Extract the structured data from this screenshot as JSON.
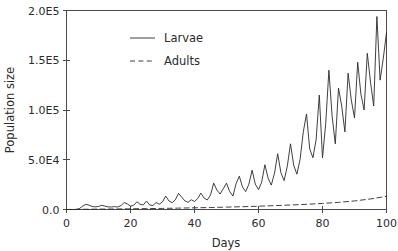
{
  "chart_data": {
    "type": "line",
    "title": "",
    "xlabel": "Days",
    "ylabel": "Population size",
    "xlim": [
      0,
      100
    ],
    "ylim": [
      0,
      200000
    ],
    "grid": false,
    "legend_position": "upper-left-inside",
    "xticks": [
      0,
      20,
      40,
      60,
      80,
      100
    ],
    "xticklabels": [
      "0",
      "20",
      "40",
      "60",
      "80",
      "100"
    ],
    "yticks": [
      0,
      50000,
      100000,
      150000,
      200000
    ],
    "yticklabels": [
      "0.0",
      "5.0E4",
      "1.0E5",
      "1.5E5",
      "2.0E5"
    ],
    "series": [
      {
        "name": "Larvae",
        "style": "solid",
        "color": "#2a2a2a",
        "x": [
          0,
          1,
          2,
          3,
          4,
          5,
          6,
          7,
          8,
          9,
          10,
          11,
          12,
          13,
          14,
          15,
          16,
          17,
          18,
          19,
          20,
          21,
          22,
          23,
          24,
          25,
          26,
          27,
          28,
          29,
          30,
          31,
          32,
          33,
          34,
          35,
          36,
          37,
          38,
          39,
          40,
          41,
          42,
          43,
          44,
          45,
          46,
          47,
          48,
          49,
          50,
          51,
          52,
          53,
          54,
          55,
          56,
          57,
          58,
          59,
          60,
          61,
          62,
          63,
          64,
          65,
          66,
          67,
          68,
          69,
          70,
          71,
          72,
          73,
          74,
          75,
          76,
          77,
          78,
          79,
          80,
          81,
          82,
          83,
          84,
          85,
          86,
          87,
          88,
          89,
          90,
          91,
          92,
          93,
          94,
          95,
          96,
          97,
          98,
          99,
          100
        ],
        "y": [
          0,
          0,
          0,
          0,
          900,
          3300,
          5200,
          4400,
          3000,
          2600,
          3100,
          4200,
          3400,
          2600,
          2500,
          2900,
          2500,
          3800,
          7000,
          5600,
          3400,
          4300,
          7800,
          5200,
          4600,
          8500,
          4500,
          4000,
          7000,
          5300,
          7700,
          13500,
          8600,
          6800,
          9700,
          16200,
          12500,
          8600,
          7200,
          9800,
          8000,
          11000,
          16500,
          11500,
          9600,
          14500,
          26500,
          19500,
          15500,
          21000,
          26500,
          18000,
          13500,
          26000,
          33500,
          22500,
          18000,
          25500,
          39500,
          25500,
          20000,
          27500,
          45000,
          31500,
          24500,
          36500,
          56000,
          37000,
          29000,
          43500,
          66000,
          44500,
          35500,
          50500,
          78000,
          96000,
          61000,
          52000,
          70000,
          115000,
          52000,
          86000,
          140000,
          94000,
          66000,
          122000,
          104000,
          78000,
          137000,
          110000,
          92000,
          148000,
          116000,
          100000,
          157000,
          128000,
          104000,
          194000,
          130000,
          152000,
          178000
        ]
      },
      {
        "name": "Adults",
        "style": "dashed",
        "color": "#2a2a2a",
        "x": [
          0,
          5,
          10,
          15,
          20,
          25,
          30,
          35,
          40,
          45,
          50,
          55,
          60,
          65,
          70,
          75,
          80,
          85,
          90,
          95,
          100
        ],
        "y": [
          0,
          200,
          400,
          500,
          700,
          900,
          1100,
          1400,
          1700,
          2000,
          2400,
          2800,
          3300,
          3900,
          4500,
          5200,
          6100,
          7200,
          8600,
          10600,
          13200
        ]
      }
    ],
    "legend": [
      {
        "label": "Larvae",
        "style": "solid"
      },
      {
        "label": "Adults",
        "style": "dashed"
      }
    ]
  },
  "axes": {
    "x_axis_title": "Days",
    "y_axis_title": "Population size"
  }
}
